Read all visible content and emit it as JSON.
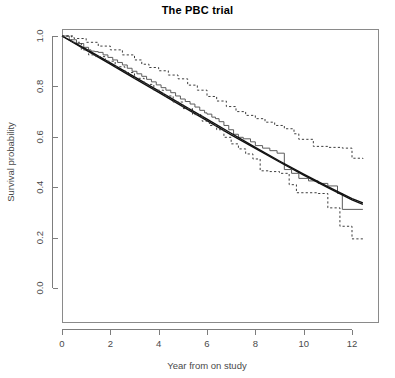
{
  "chart": {
    "title": "The PBC trial",
    "xlabel": "Year from on study",
    "ylabel": "Survival probability"
  },
  "chart_data": {
    "type": "line",
    "title": "The PBC trial",
    "xlabel": "Year from on study",
    "ylabel": "Survival probability",
    "xlim": [
      0,
      12.8
    ],
    "ylim": [
      0.0,
      1.0
    ],
    "xticks": [
      0,
      2,
      4,
      6,
      8,
      10,
      12
    ],
    "xtick_labels": [
      "0",
      "2",
      "4",
      "6",
      "8",
      "10",
      "12"
    ],
    "yticks": [
      0.0,
      0.2,
      0.4,
      0.6,
      0.8,
      1.0
    ],
    "ytick_labels": [
      "0.0",
      "0.2",
      "0.4",
      "0.6",
      "0.8",
      "1.0"
    ],
    "grid": false,
    "legend": null,
    "series": [
      {
        "name": "Kaplan-Meier estimate",
        "style": "step",
        "linestyle": "solid",
        "color": "#5c5c5c",
        "x": [
          0.0,
          0.3,
          0.6,
          0.9,
          1.1,
          1.2,
          1.35,
          1.5,
          1.7,
          1.9,
          2.1,
          2.3,
          2.5,
          2.7,
          2.9,
          3.1,
          3.3,
          3.5,
          3.7,
          3.9,
          4.1,
          4.3,
          4.5,
          4.7,
          4.9,
          5.1,
          5.3,
          5.5,
          5.7,
          5.9,
          6.0,
          6.2,
          6.35,
          6.5,
          6.7,
          6.9,
          7.1,
          7.3,
          7.5,
          7.8,
          8.0,
          8.3,
          8.6,
          8.9,
          9.2,
          9.5,
          9.8,
          10.2,
          10.6,
          11.0,
          11.4,
          11.6,
          12.0,
          12.45
        ],
        "y": [
          1.0,
          0.985,
          0.97,
          0.955,
          0.945,
          0.94,
          0.938,
          0.935,
          0.925,
          0.915,
          0.905,
          0.895,
          0.885,
          0.872,
          0.86,
          0.85,
          0.84,
          0.828,
          0.818,
          0.806,
          0.795,
          0.785,
          0.775,
          0.762,
          0.75,
          0.74,
          0.73,
          0.718,
          0.705,
          0.695,
          0.69,
          0.678,
          0.672,
          0.66,
          0.645,
          0.628,
          0.61,
          0.598,
          0.592,
          0.58,
          0.565,
          0.555,
          0.545,
          0.535,
          0.47,
          0.455,
          0.435,
          0.425,
          0.415,
          0.405,
          0.375,
          0.312,
          0.312,
          0.312
        ]
      },
      {
        "name": "Fitted model A",
        "style": "smooth",
        "linestyle": "solid",
        "color": "#111111",
        "x": [
          0.0,
          1.0,
          2.0,
          3.0,
          4.0,
          5.0,
          6.0,
          7.0,
          8.0,
          9.0,
          10.0,
          11.0,
          12.0,
          12.45
        ],
        "y": [
          1.0,
          0.948,
          0.893,
          0.838,
          0.782,
          0.726,
          0.67,
          0.614,
          0.558,
          0.504,
          0.452,
          0.402,
          0.355,
          0.338
        ]
      },
      {
        "name": "Fitted model B",
        "style": "smooth",
        "linestyle": "solid",
        "color": "#111111",
        "x": [
          0.0,
          1.0,
          2.0,
          3.0,
          4.0,
          5.0,
          6.0,
          7.0,
          8.0,
          9.0,
          10.0,
          11.0,
          12.0,
          12.45
        ],
        "y": [
          1.0,
          0.944,
          0.888,
          0.832,
          0.776,
          0.72,
          0.664,
          0.608,
          0.554,
          0.5,
          0.448,
          0.398,
          0.35,
          0.332
        ]
      },
      {
        "name": "Upper 95% confidence limit",
        "style": "step",
        "linestyle": "dashed",
        "color": "#3d3d3d",
        "x": [
          0.0,
          0.5,
          1.0,
          1.5,
          2.0,
          2.5,
          3.0,
          3.3,
          3.6,
          4.0,
          4.4,
          4.8,
          5.2,
          5.6,
          6.0,
          6.4,
          6.8,
          7.2,
          7.6,
          8.0,
          8.4,
          8.8,
          9.2,
          9.6,
          9.8,
          10.4,
          11.0,
          11.6,
          12.0,
          12.45
        ],
        "y": [
          1.0,
          0.99,
          0.975,
          0.96,
          0.945,
          0.925,
          0.905,
          0.888,
          0.875,
          0.862,
          0.845,
          0.83,
          0.805,
          0.785,
          0.76,
          0.742,
          0.72,
          0.7,
          0.685,
          0.672,
          0.658,
          0.645,
          0.632,
          0.612,
          0.59,
          0.562,
          0.558,
          0.555,
          0.515,
          0.512
        ]
      },
      {
        "name": "Lower 95% confidence limit",
        "style": "step",
        "linestyle": "dashed",
        "color": "#3d3d3d",
        "x": [
          0.0,
          0.4,
          0.8,
          1.1,
          1.4,
          1.8,
          2.2,
          2.6,
          3.0,
          3.4,
          3.8,
          4.2,
          4.6,
          5.0,
          5.4,
          5.8,
          6.1,
          6.4,
          6.7,
          7.0,
          7.3,
          7.6,
          7.9,
          8.2,
          8.6,
          9.0,
          9.4,
          9.7,
          10.0,
          10.6,
          11.0,
          11.2,
          11.5,
          12.0,
          12.45
        ],
        "y": [
          1.0,
          0.975,
          0.945,
          0.925,
          0.918,
          0.9,
          0.878,
          0.855,
          0.832,
          0.808,
          0.785,
          0.762,
          0.738,
          0.712,
          0.688,
          0.662,
          0.645,
          0.628,
          0.598,
          0.572,
          0.552,
          0.532,
          0.512,
          0.465,
          0.462,
          0.455,
          0.41,
          0.378,
          0.378,
          0.375,
          0.318,
          0.318,
          0.245,
          0.195,
          0.195
        ]
      }
    ]
  }
}
